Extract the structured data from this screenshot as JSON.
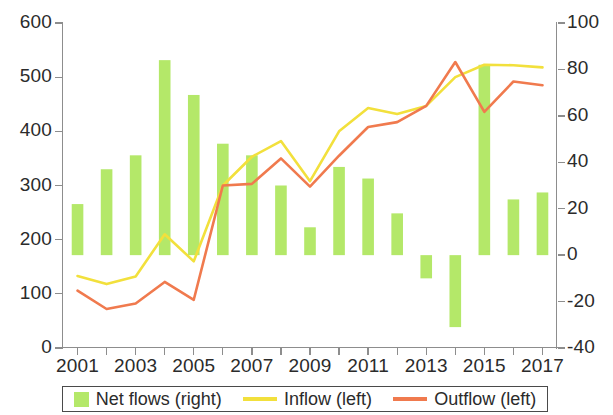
{
  "chart_data": {
    "type": "bar",
    "title": "",
    "subtitle": "",
    "xlabel": "",
    "ylabel": "",
    "ylabel_right": "",
    "grid": false,
    "legend_position": "bottom",
    "x": [
      2001,
      2002,
      2003,
      2004,
      2005,
      2006,
      2007,
      2008,
      2009,
      2010,
      2011,
      2012,
      2013,
      2014,
      2015,
      2016,
      2017
    ],
    "categories": [
      "2001",
      "2002",
      "2003",
      "2004",
      "2005",
      "2006",
      "2007",
      "2008",
      "2009",
      "2010",
      "2011",
      "2012",
      "2013",
      "2014",
      "2015",
      "2016",
      "2017"
    ],
    "xtick_labels": [
      "2001",
      "2003",
      "2005",
      "2007",
      "2009",
      "2011",
      "2013",
      "2015",
      "2017"
    ],
    "xtick_values": [
      2001,
      2003,
      2005,
      2007,
      2009,
      2011,
      2013,
      2015,
      2017
    ],
    "ylim_left": [
      0,
      600
    ],
    "ytick_labels_left": [
      "0",
      "100",
      "200",
      "300",
      "400",
      "500",
      "600"
    ],
    "ytick_values_left": [
      0,
      100,
      200,
      300,
      400,
      500,
      600
    ],
    "ylim_right": [
      -40,
      100
    ],
    "ytick_labels_right": [
      "-40",
      "-20",
      "0",
      "20",
      "40",
      "60",
      "80",
      "100"
    ],
    "ytick_values_right": [
      -40,
      -20,
      0,
      20,
      40,
      60,
      80,
      100
    ],
    "series": [
      {
        "name": "Net flows (right)",
        "type": "bar",
        "axis": "right",
        "color": "#b4e869",
        "values": [
          22,
          37,
          43,
          84,
          69,
          48,
          43,
          30,
          12,
          38,
          33,
          18,
          -10,
          -31,
          82,
          24,
          27
        ]
      },
      {
        "name": "Inflow (left)",
        "type": "line",
        "axis": "left",
        "color": "#f2e03c",
        "values": [
          133,
          118,
          132,
          210,
          160,
          300,
          353,
          382,
          308,
          400,
          443,
          432,
          447,
          500,
          523,
          522,
          518
        ]
      },
      {
        "name": "Outflow (left)",
        "type": "line",
        "axis": "left",
        "color": "#f07a4e",
        "values": [
          106,
          72,
          82,
          122,
          89,
          300,
          303,
          350,
          298,
          355,
          408,
          417,
          447,
          528,
          436,
          492,
          485
        ]
      }
    ]
  },
  "legend": {
    "items": [
      {
        "label": "Net flows (right)",
        "color": "#b4e869",
        "marker": "box"
      },
      {
        "label": "Inflow (left)",
        "color": "#f2e03c",
        "marker": "line"
      },
      {
        "label": "Outflow (left)",
        "color": "#f07a4e",
        "marker": "line"
      }
    ]
  },
  "colors": {
    "bar_green": "#b4e869",
    "inflow_yellow": "#f2e03c",
    "outflow_orange": "#f07a4e",
    "axis_gray": "#8d8d8d",
    "text": "#2b2b2b",
    "background": "#ffffff"
  }
}
